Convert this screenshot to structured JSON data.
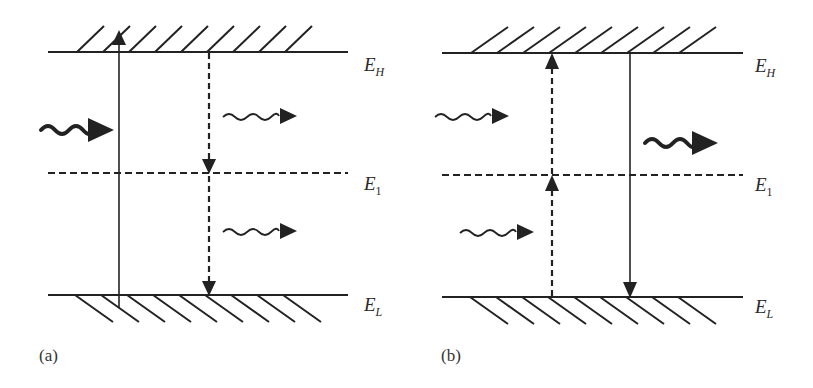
{
  "figure": {
    "colors": {
      "stroke": "#222222",
      "background": "#ffffff"
    },
    "panels": [
      {
        "id": "a",
        "label": "(a)",
        "levels": [
          {
            "name": "E",
            "sub": "H",
            "style": "solid",
            "hatch": "above"
          },
          {
            "name": "E",
            "sub": "1",
            "style": "dashed",
            "hatch": "none"
          },
          {
            "name": "E",
            "sub": "L",
            "style": "solid",
            "hatch": "below"
          }
        ],
        "transitions": [
          {
            "type": "solid",
            "direction": "up",
            "from": "E_L",
            "to": "E_H",
            "description": "absorption"
          },
          {
            "type": "dashed",
            "direction": "down",
            "from": "E_H",
            "to": "E_1"
          },
          {
            "type": "dashed",
            "direction": "down",
            "from": "E_1",
            "to": "E_L"
          }
        ],
        "photons": [
          {
            "weight": "bold",
            "role": "incoming",
            "position": "left"
          },
          {
            "weight": "thin",
            "role": "emitted",
            "position": "upper-right"
          },
          {
            "weight": "thin",
            "role": "emitted",
            "position": "lower-right"
          }
        ]
      },
      {
        "id": "b",
        "label": "(b)",
        "levels": [
          {
            "name": "E",
            "sub": "H",
            "style": "solid",
            "hatch": "above"
          },
          {
            "name": "E",
            "sub": "1",
            "style": "dashed",
            "hatch": "none"
          },
          {
            "name": "E",
            "sub": "L",
            "style": "solid",
            "hatch": "below"
          }
        ],
        "transitions": [
          {
            "type": "dashed",
            "direction": "up",
            "from": "E_L",
            "to": "E_1"
          },
          {
            "type": "dashed",
            "direction": "up",
            "from": "E_1",
            "to": "E_H"
          },
          {
            "type": "solid",
            "direction": "down",
            "from": "E_H",
            "to": "E_L",
            "description": "emission"
          }
        ],
        "photons": [
          {
            "weight": "thin",
            "role": "incoming",
            "position": "upper-left"
          },
          {
            "weight": "thin",
            "role": "incoming",
            "position": "lower-left"
          },
          {
            "weight": "bold",
            "role": "emitted",
            "position": "right"
          }
        ]
      }
    ]
  }
}
